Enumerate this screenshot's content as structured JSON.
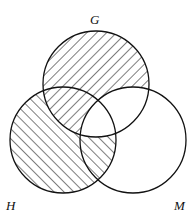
{
  "diagram": {
    "type": "venn",
    "sets": [
      {
        "name": "G",
        "cx": 96,
        "cy": 84,
        "r": 53,
        "hatch": "backslash"
      },
      {
        "name": "H",
        "cx": 63,
        "cy": 140,
        "r": 53,
        "hatch": "slash"
      },
      {
        "name": "M",
        "cx": 133,
        "cy": 140,
        "r": 53,
        "hatch": "none"
      }
    ],
    "labels": {
      "g": "G",
      "h": "H",
      "m": "M"
    },
    "shaded_regions": [
      "G only",
      "H only",
      "G∩H not M",
      "H∩M not G"
    ],
    "unshaded_regions": [
      "M only",
      "G∩M not H",
      "G∩H∩M"
    ],
    "stroke_color": "#111111",
    "background": "#ffffff"
  }
}
